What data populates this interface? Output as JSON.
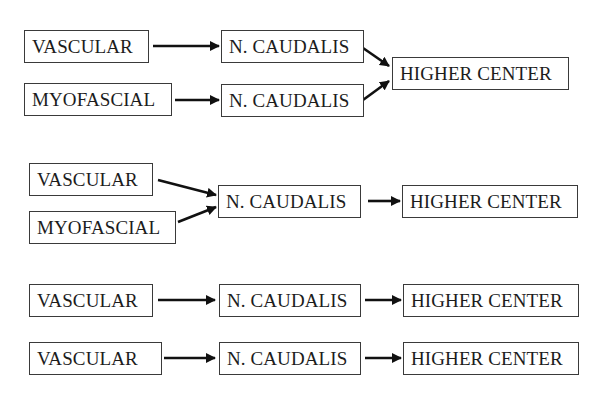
{
  "diagram": {
    "type": "flow",
    "rows": [
      {
        "id": "row1",
        "nodes": [
          {
            "id": "r1-vascular",
            "label": "VASCULAR"
          },
          {
            "id": "r1-myofascial",
            "label": "MYOFASCIAL"
          },
          {
            "id": "r1-caudalis-a",
            "label": "N. CAUDALIS"
          },
          {
            "id": "r1-caudalis-b",
            "label": "N. CAUDALIS"
          },
          {
            "id": "r1-higher",
            "label": "HIGHER CENTER"
          }
        ],
        "edges": [
          [
            "r1-vascular",
            "r1-caudalis-a"
          ],
          [
            "r1-myofascial",
            "r1-caudalis-b"
          ],
          [
            "r1-caudalis-a",
            "r1-higher"
          ],
          [
            "r1-caudalis-b",
            "r1-higher"
          ]
        ]
      },
      {
        "id": "row2",
        "nodes": [
          {
            "id": "r2-vascular",
            "label": "VASCULAR"
          },
          {
            "id": "r2-myofascial",
            "label": "MYOFASCIAL"
          },
          {
            "id": "r2-caudalis",
            "label": "N. CAUDALIS"
          },
          {
            "id": "r2-higher",
            "label": "HIGHER CENTER"
          }
        ],
        "edges": [
          [
            "r2-vascular",
            "r2-caudalis"
          ],
          [
            "r2-myofascial",
            "r2-caudalis"
          ],
          [
            "r2-caudalis",
            "r2-higher"
          ]
        ]
      },
      {
        "id": "row3",
        "nodes": [
          {
            "id": "r3-vascular",
            "label": "VASCULAR"
          },
          {
            "id": "r3-caudalis",
            "label": "N. CAUDALIS"
          },
          {
            "id": "r3-higher",
            "label": "HIGHER CENTER"
          }
        ],
        "edges": [
          [
            "r3-vascular",
            "r3-caudalis"
          ],
          [
            "r3-caudalis",
            "r3-higher"
          ]
        ]
      },
      {
        "id": "row4",
        "nodes": [
          {
            "id": "r4-vascular",
            "label": "VASCULAR"
          },
          {
            "id": "r4-caudalis",
            "label": "N. CAUDALIS"
          },
          {
            "id": "r4-higher",
            "label": "HIGHER CENTER"
          }
        ],
        "edges": [
          [
            "r4-vascular",
            "r4-caudalis"
          ],
          [
            "r4-caudalis",
            "r4-higher"
          ]
        ]
      }
    ]
  }
}
